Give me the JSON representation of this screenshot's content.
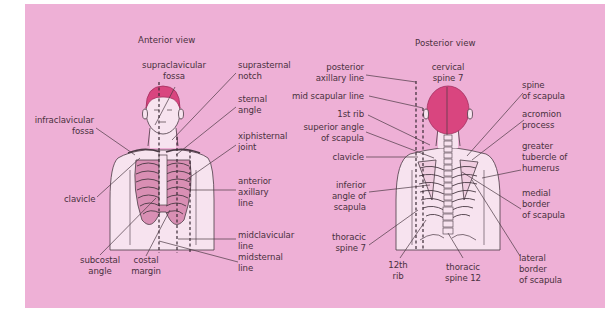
{
  "colors": {
    "panel_background": "#eeb0d6",
    "page_background": "#ffffff",
    "skin": "#f7e3ef",
    "hair": "#d9457f",
    "outline": "#4a3a44",
    "label_text": "#4a3040"
  },
  "anterior": {
    "title": "Anterior view",
    "labels": {
      "supraclavicular_fossa": "supraclavicular\nfossa",
      "suprasternal_notch": "suprasternal\nnotch",
      "sternal_angle": "sternal\nangle",
      "infraclavicular_fossa": "infraclavicular\nfossa",
      "xiphisternal_joint": "xiphisternal\njoint",
      "clavicle": "clavicle",
      "anterior_axillary_line": "anterior\naxillary\nline",
      "midclavicular_line": "midclavicular\nline",
      "midsternal_line": "midsternal\nline",
      "subcostal_angle": "subcostal\nangle",
      "costal_margin": "costal\nmargin"
    }
  },
  "posterior": {
    "title": "Posterior view",
    "labels": {
      "posterior_axillary_line": "posterior\naxillary line",
      "cervical_spine_7": "cervical\nspine 7",
      "mid_scapular_line": "mid scapular line",
      "first_rib": "1st rib",
      "superior_angle_of_scapula": "superior angle\nof scapula",
      "clavicle": "clavicle",
      "spine_of_scapula": "spine\nof scapula",
      "acromion_process": "acromion\nprocess",
      "greater_tubercle_of_humerus": "greater\ntubercle of\nhumerus",
      "inferior_angle_of_scapula": "inferior\nangle of\nscapula",
      "medial_border_of_scapula": "medial\nborder\nof scapula",
      "thoracic_spine_7": "thoracic\nspine 7",
      "twelfth_rib": "12th\nrib",
      "thoracic_spine_12": "thoracic\nspine 12",
      "lateral_border_of_scapula": "lateral\nborder\nof scapula"
    }
  }
}
